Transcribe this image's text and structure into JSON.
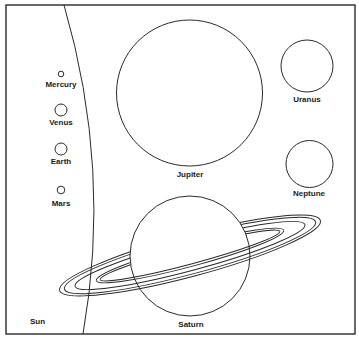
{
  "colors": {
    "stroke": "#2a2a2a",
    "background": "#ffffff"
  },
  "sun": {
    "label": "Sun"
  },
  "planets": [
    {
      "name": "Mercury",
      "label": "Mercury"
    },
    {
      "name": "Venus",
      "label": "Venus"
    },
    {
      "name": "Earth",
      "label": "Earth"
    },
    {
      "name": "Mars",
      "label": "Mars"
    },
    {
      "name": "Jupiter",
      "label": "Jupiter"
    },
    {
      "name": "Saturn",
      "label": "Saturn"
    },
    {
      "name": "Uranus",
      "label": "Uranus"
    },
    {
      "name": "Neptune",
      "label": "Neptune"
    }
  ]
}
